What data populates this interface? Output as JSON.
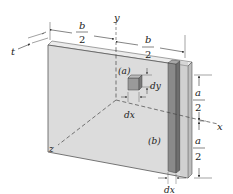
{
  "diagram": {
    "axes": {
      "x": "x",
      "y": "y",
      "z": "z"
    },
    "thickness_label": "t",
    "dimensions": {
      "half_width_left": {
        "num": "b",
        "den": "2"
      },
      "half_width_right": {
        "num": "b",
        "den": "2"
      },
      "half_height_top": {
        "num": "a",
        "den": "2"
      },
      "half_height_bottom": {
        "num": "a",
        "den": "2"
      }
    },
    "element_a": {
      "label": "(a)",
      "dx": "dx",
      "dy": "dy"
    },
    "element_b": {
      "label": "(b)",
      "dx": "dx"
    },
    "colors": {
      "plate_face": "#dcdcdc",
      "plate_edge": "#555555",
      "strip_dark": "#8a8a8a",
      "strip_light": "#c8c8c8",
      "element_cube": "#9a9a9a"
    }
  }
}
